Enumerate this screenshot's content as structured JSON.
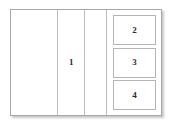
{
  "wireframe": {
    "background_color": "#ffffff",
    "border_color": "#a8a8a8",
    "divider_color": "#bdbdbd",
    "box_border_color": "#b5b5b5",
    "label_color": "#2b2b2b"
  },
  "regions": {
    "left_panel": {
      "label": ""
    },
    "main_column": {
      "label": "1"
    },
    "narrow_column": {
      "label": ""
    }
  },
  "sidebar": {
    "boxes": [
      {
        "label": "2"
      },
      {
        "label": "3"
      },
      {
        "label": "4"
      }
    ]
  }
}
